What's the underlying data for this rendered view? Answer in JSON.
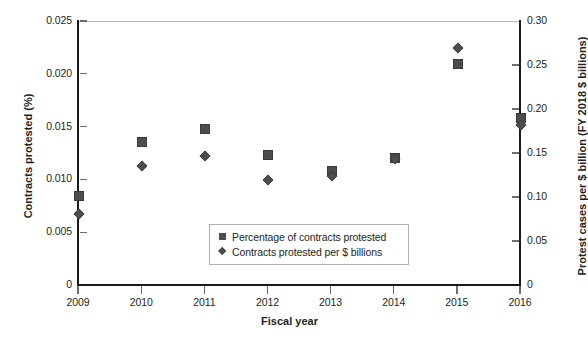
{
  "chart_data": {
    "type": "scatter",
    "title": "",
    "xlabel": "Fiscal year",
    "ylabel": "Contracts protested (%)",
    "y2label": "Protest cases per $ billion (FY 2018 $ billions)",
    "grid": false,
    "legend_position": "inside-bottom-center",
    "categories": [
      "2009",
      "2010",
      "2011",
      "2012",
      "2013",
      "2014",
      "2015",
      "2016"
    ],
    "x": [
      2009,
      2010,
      2011,
      2012,
      2013,
      2014,
      2015,
      2016
    ],
    "xlim": [
      2009,
      2016
    ],
    "ylim": [
      0,
      0.025
    ],
    "y2lim": [
      0,
      0.3
    ],
    "yticks": [
      "0",
      "0.005",
      "0.010",
      "0.015",
      "0.020",
      "0.025"
    ],
    "ytick_values": [
      0,
      0.005,
      0.01,
      0.015,
      0.02,
      0.025
    ],
    "y2ticks": [
      "0",
      "0.05",
      "0.10",
      "0.15",
      "0.20",
      "0.25",
      "0.30"
    ],
    "y2tick_values": [
      0,
      0.05,
      0.1,
      0.15,
      0.2,
      0.25,
      0.3
    ],
    "series": [
      {
        "name": "Percentage of contracts protested",
        "marker": "square",
        "axis": "left",
        "color": "#4d4d4d",
        "values": [
          0.0085,
          0.0136,
          0.0149,
          0.0124,
          0.0109,
          0.0121,
          0.021,
          0.0159
        ]
      },
      {
        "name": "Contracts protested per $ billions",
        "marker": "diamond",
        "axis": "right",
        "color": "#4d4d4d",
        "values": [
          0.0068,
          0.0114,
          0.0123,
          0.01,
          0.0104,
          0.012,
          0.0225,
          0.0152
        ]
      }
    ]
  },
  "legend": {
    "items": [
      {
        "label": "Percentage of contracts protested",
        "marker": "square"
      },
      {
        "label": "Contracts protested per $ billions",
        "marker": "diamond"
      }
    ]
  }
}
